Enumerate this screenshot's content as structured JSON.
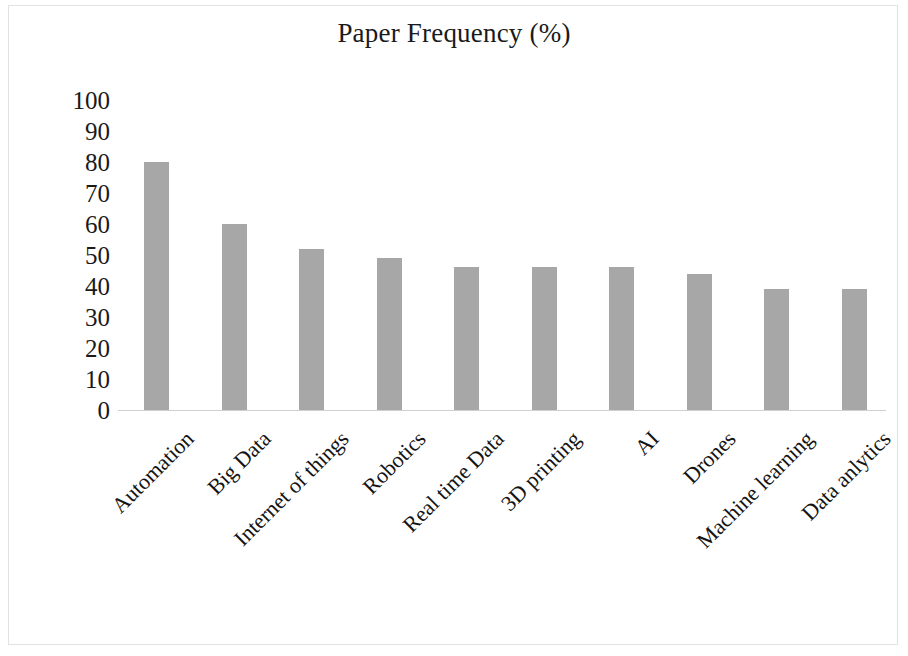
{
  "chart_data": {
    "type": "bar",
    "title": "Paper Frequency (%)",
    "xlabel": "",
    "ylabel": "",
    "ylim": [
      0,
      100
    ],
    "ytick_step": 10,
    "ytick_labels": [
      "100",
      "90",
      "80",
      "70",
      "60",
      "50",
      "40",
      "30",
      "20",
      "10",
      "0"
    ],
    "grid": false,
    "legend": "none",
    "bar_color": "#a7a7a7",
    "categories": [
      "Automation",
      "Big Data",
      "Internet of things",
      "Robotics",
      "Real time Data",
      "3D printing",
      "AI",
      "Drones",
      "Machine learning",
      "Data anlytics"
    ],
    "values": [
      80,
      60,
      52,
      49,
      46,
      46,
      46,
      44,
      39,
      39
    ]
  },
  "figure": {
    "background": "#ffffff",
    "border_color": "#e2e2e2",
    "axis_color": "#d0d0d0",
    "text_color": "#1a1a1a"
  }
}
